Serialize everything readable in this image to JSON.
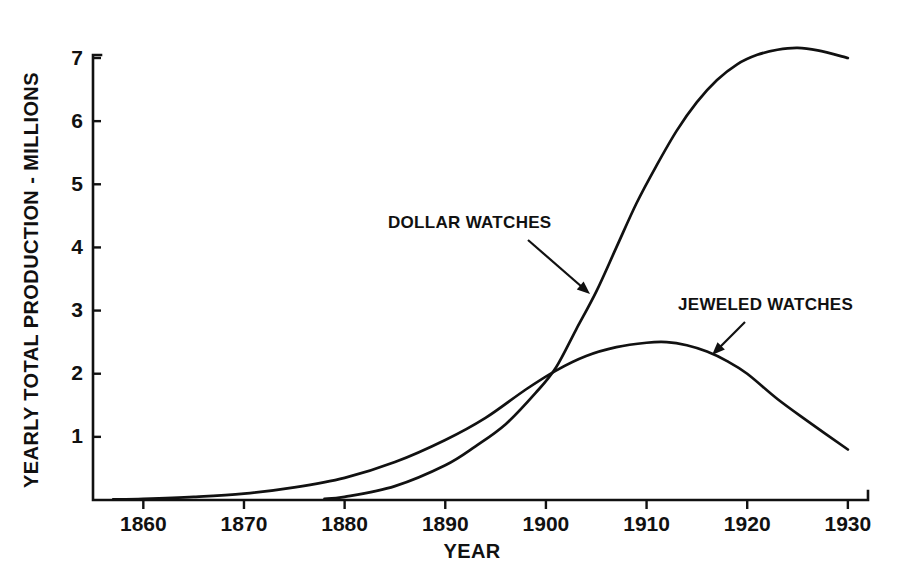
{
  "chart_data": {
    "type": "line",
    "title": "",
    "xlabel": "YEAR",
    "ylabel": "YEARLY TOTAL PRODUCTION - MILLIONS",
    "xlim": [
      1855,
      1932
    ],
    "ylim": [
      0,
      7.4
    ],
    "xticks": [
      1860,
      1870,
      1880,
      1890,
      1900,
      1910,
      1920,
      1930
    ],
    "xtick_labels": [
      "1860",
      "1870",
      "1880",
      "1890",
      "1900",
      "1910",
      "1920",
      "1930"
    ],
    "yticks": [
      1,
      2,
      3,
      4,
      5,
      6,
      7
    ],
    "ytick_labels": [
      "1",
      "2",
      "3",
      "4",
      "5",
      "6",
      "7"
    ],
    "grid": false,
    "legend_position": "inline-annotations",
    "line_color": "#111111",
    "series": [
      {
        "name": "DOLLAR WATCHES",
        "x": [
          1878,
          1880,
          1885,
          1890,
          1893,
          1896,
          1899,
          1901,
          1903,
          1905,
          1907,
          1909,
          1911,
          1913,
          1915,
          1917,
          1919,
          1921,
          1923,
          1925,
          1927,
          1930
        ],
        "values": [
          0.02,
          0.05,
          0.22,
          0.55,
          0.85,
          1.2,
          1.7,
          2.1,
          2.7,
          3.3,
          4.0,
          4.7,
          5.3,
          5.85,
          6.3,
          6.65,
          6.9,
          7.05,
          7.13,
          7.16,
          7.12,
          7.0
        ]
      },
      {
        "name": "JEWELED WATCHES",
        "x": [
          1857,
          1860,
          1865,
          1870,
          1875,
          1880,
          1885,
          1890,
          1894,
          1898,
          1901,
          1904,
          1907,
          1910,
          1912,
          1914,
          1916,
          1918,
          1920,
          1923,
          1926,
          1930
        ],
        "values": [
          0.01,
          0.02,
          0.05,
          0.1,
          0.2,
          0.35,
          0.6,
          0.95,
          1.3,
          1.75,
          2.05,
          2.28,
          2.42,
          2.49,
          2.5,
          2.45,
          2.35,
          2.2,
          2.0,
          1.6,
          1.25,
          0.8
        ]
      }
    ],
    "annotations": [
      {
        "text": "DOLLAR WATCHES",
        "label_x": 388,
        "label_y": 228,
        "arrow_from_x": 528,
        "arrow_from_y": 240,
        "arrow_to_x": 590,
        "arrow_to_y": 294
      },
      {
        "text": "JEWELED WATCHES",
        "label_x": 678,
        "label_y": 310,
        "arrow_from_x": 745,
        "arrow_from_y": 322,
        "arrow_to_x": 712,
        "arrow_to_y": 355
      }
    ]
  }
}
